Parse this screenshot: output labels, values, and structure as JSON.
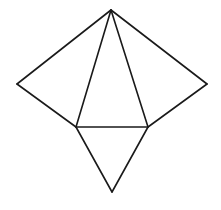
{
  "diagram": {
    "type": "tetrahedron-net",
    "background": "#ffffff",
    "stroke_color": "#1a1a1a",
    "vertices": {
      "apex": [
        111,
        10
      ],
      "left": [
        17,
        84
      ],
      "right": [
        207,
        84
      ],
      "base_left": [
        76,
        127
      ],
      "base_right": [
        148,
        127
      ],
      "bottom": [
        112,
        192
      ]
    },
    "edges": [
      [
        "apex",
        "left"
      ],
      [
        "left",
        "base_left"
      ],
      [
        "apex",
        "base_left"
      ],
      [
        "apex",
        "base_right"
      ],
      [
        "apex",
        "right"
      ],
      [
        "right",
        "base_right"
      ],
      [
        "base_left",
        "base_right"
      ],
      [
        "base_left",
        "bottom"
      ],
      [
        "base_right",
        "bottom"
      ]
    ],
    "faces": [
      {
        "name": "center-face",
        "vertices": [
          "apex",
          "base_left",
          "base_right"
        ]
      },
      {
        "name": "left-face",
        "vertices": [
          "apex",
          "left",
          "base_left"
        ]
      },
      {
        "name": "right-face",
        "vertices": [
          "apex",
          "right",
          "base_right"
        ]
      },
      {
        "name": "bottom-face",
        "vertices": [
          "base_left",
          "base_right",
          "bottom"
        ]
      }
    ]
  }
}
